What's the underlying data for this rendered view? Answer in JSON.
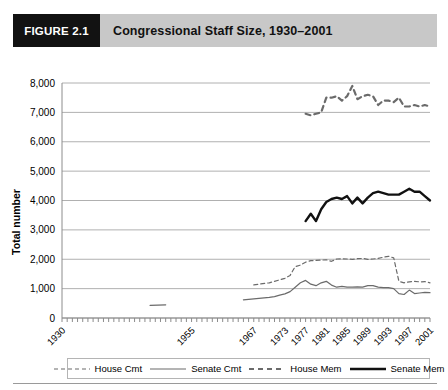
{
  "figure": {
    "tag": "FIGURE 2.1",
    "title": "Congressional Staff Size, 1930–2001"
  },
  "colors": {
    "tag_background": "#121212",
    "header_background": "#c8c8c8",
    "gridline": "#b0b0b0",
    "axis": "#8c8c8c",
    "series_thin": "#6b6b6b",
    "series_thick": "#111111",
    "plot_background": "#ffffff"
  },
  "chart_data": {
    "type": "line",
    "title": "Congressional Staff Size, 1930–2001",
    "xlabel": "",
    "ylabel": "Total number",
    "ylim": [
      0,
      8000
    ],
    "ytick_labels": [
      "0",
      "1,000",
      "2,000",
      "3,000",
      "4,000",
      "5,000",
      "6,000",
      "7,000",
      "8,000"
    ],
    "ytick_values": [
      0,
      1000,
      2000,
      3000,
      4000,
      5000,
      6000,
      7000,
      8000
    ],
    "xtick_labels": [
      "1930",
      "1955",
      "1967",
      "1973",
      "1977",
      "1981",
      "1985",
      "1989",
      "1993",
      "1997",
      "2001"
    ],
    "xtick_values": [
      1930,
      1955,
      1967,
      1973,
      1977,
      1981,
      1985,
      1989,
      1993,
      1997,
      2001
    ],
    "xlim": [
      1930,
      2001
    ],
    "grid": "horizontal",
    "legend_position": "bottom",
    "series": [
      {
        "name": "House Cmt",
        "style": "dashed-thin",
        "color": "#6b6b6b",
        "points": [
          [
            1930,
            870
          ],
          [
            1935,
            870
          ],
          [
            1947,
            1250
          ],
          [
            1955,
            1000
          ],
          [
            1960,
            1100
          ],
          [
            1967,
            1130
          ],
          [
            1970,
            1200
          ],
          [
            1973,
            1350
          ],
          [
            1974,
            1450
          ],
          [
            1975,
            1750
          ],
          [
            1976,
            1800
          ],
          [
            1977,
            1900
          ],
          [
            1978,
            1950
          ],
          [
            1979,
            1960
          ],
          [
            1980,
            1970
          ],
          [
            1981,
            1980
          ],
          [
            1982,
            1930
          ],
          [
            1983,
            2010
          ],
          [
            1984,
            2020
          ],
          [
            1985,
            2010
          ],
          [
            1986,
            2000
          ],
          [
            1987,
            2020
          ],
          [
            1988,
            2030
          ],
          [
            1989,
            2000
          ],
          [
            1990,
            2010
          ],
          [
            1991,
            2030
          ],
          [
            1992,
            2070
          ],
          [
            1993,
            2100
          ],
          [
            1994,
            2050
          ],
          [
            1995,
            1250
          ],
          [
            1996,
            1200
          ],
          [
            1997,
            1230
          ],
          [
            1998,
            1250
          ],
          [
            1999,
            1230
          ],
          [
            2000,
            1240
          ],
          [
            2001,
            1200
          ]
        ]
      },
      {
        "name": "Senate Cmt",
        "style": "solid-thin",
        "color": "#6b6b6b",
        "points": [
          [
            1930,
            280
          ],
          [
            1935,
            300
          ],
          [
            1940,
            350
          ],
          [
            1947,
            430
          ],
          [
            1950,
            450
          ],
          [
            1955,
            430
          ],
          [
            1960,
            560
          ],
          [
            1965,
            620
          ],
          [
            1967,
            650
          ],
          [
            1970,
            700
          ],
          [
            1971,
            730
          ],
          [
            1972,
            780
          ],
          [
            1973,
            820
          ],
          [
            1974,
            900
          ],
          [
            1975,
            1050
          ],
          [
            1976,
            1200
          ],
          [
            1977,
            1280
          ],
          [
            1978,
            1150
          ],
          [
            1979,
            1100
          ],
          [
            1980,
            1200
          ],
          [
            1981,
            1250
          ],
          [
            1982,
            1120
          ],
          [
            1983,
            1050
          ],
          [
            1984,
            1080
          ],
          [
            1985,
            1050
          ],
          [
            1986,
            1050
          ],
          [
            1987,
            1060
          ],
          [
            1988,
            1050
          ],
          [
            1989,
            1100
          ],
          [
            1990,
            1100
          ],
          [
            1991,
            1050
          ],
          [
            1992,
            1030
          ],
          [
            1993,
            1030
          ],
          [
            1994,
            1000
          ],
          [
            1995,
            830
          ],
          [
            1996,
            800
          ],
          [
            1997,
            950
          ],
          [
            1998,
            830
          ],
          [
            1999,
            850
          ],
          [
            2000,
            870
          ],
          [
            2001,
            860
          ]
        ]
      },
      {
        "name": "House Mem",
        "style": "dashed-thick",
        "color": "#6b6b6b",
        "points": [
          [
            1977,
            6950
          ],
          [
            1978,
            6900
          ],
          [
            1979,
            6950
          ],
          [
            1980,
            7000
          ],
          [
            1981,
            7500
          ],
          [
            1982,
            7500
          ],
          [
            1983,
            7550
          ],
          [
            1984,
            7400
          ],
          [
            1985,
            7550
          ],
          [
            1986,
            7900
          ],
          [
            1987,
            7450
          ],
          [
            1988,
            7550
          ],
          [
            1989,
            7600
          ],
          [
            1990,
            7550
          ],
          [
            1991,
            7250
          ],
          [
            1992,
            7400
          ],
          [
            1993,
            7400
          ],
          [
            1994,
            7350
          ],
          [
            1995,
            7500
          ],
          [
            1996,
            7200
          ],
          [
            1997,
            7200
          ],
          [
            1998,
            7250
          ],
          [
            1999,
            7200
          ],
          [
            2000,
            7250
          ],
          [
            2001,
            7200
          ]
        ]
      },
      {
        "name": "Senate Mem",
        "style": "solid-thick",
        "color": "#111111",
        "points": [
          [
            1977,
            3300
          ],
          [
            1978,
            3550
          ],
          [
            1979,
            3300
          ],
          [
            1980,
            3700
          ],
          [
            1981,
            3950
          ],
          [
            1982,
            4050
          ],
          [
            1983,
            4100
          ],
          [
            1984,
            4050
          ],
          [
            1985,
            4150
          ],
          [
            1986,
            3900
          ],
          [
            1987,
            4100
          ],
          [
            1988,
            3900
          ],
          [
            1989,
            4100
          ],
          [
            1990,
            4250
          ],
          [
            1991,
            4300
          ],
          [
            1992,
            4250
          ],
          [
            1993,
            4200
          ],
          [
            1994,
            4200
          ],
          [
            1995,
            4200
          ],
          [
            1996,
            4300
          ],
          [
            1997,
            4400
          ],
          [
            1998,
            4300
          ],
          [
            1999,
            4300
          ],
          [
            2000,
            4150
          ],
          [
            2001,
            4000
          ]
        ]
      }
    ]
  },
  "legend": {
    "items": [
      {
        "label": "House Cmt",
        "style": "dashed-thin"
      },
      {
        "label": "Senate Cmt",
        "style": "solid-thin"
      },
      {
        "label": "House Mem",
        "style": "dashed-thick"
      },
      {
        "label": "Senate Mem",
        "style": "solid-thick"
      }
    ]
  }
}
